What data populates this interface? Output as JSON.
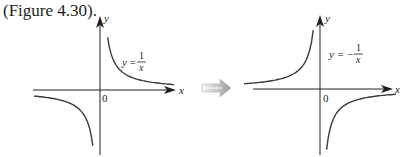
{
  "caption": "(Figure 4.30).",
  "arrow_icon": "right-arrow-icon",
  "graphs": [
    {
      "name": "reciprocal",
      "equation_lhs": "y =",
      "fraction_num": "1",
      "fraction_den": "x",
      "axis_x": "x",
      "axis_y": "y",
      "origin": "0",
      "function": "1/x"
    },
    {
      "name": "negative-reciprocal",
      "equation_lhs": "y = −",
      "fraction_num": "1",
      "fraction_den": "x",
      "axis_x": "x",
      "axis_y": "y",
      "origin": "0",
      "function": "-1/x"
    }
  ]
}
